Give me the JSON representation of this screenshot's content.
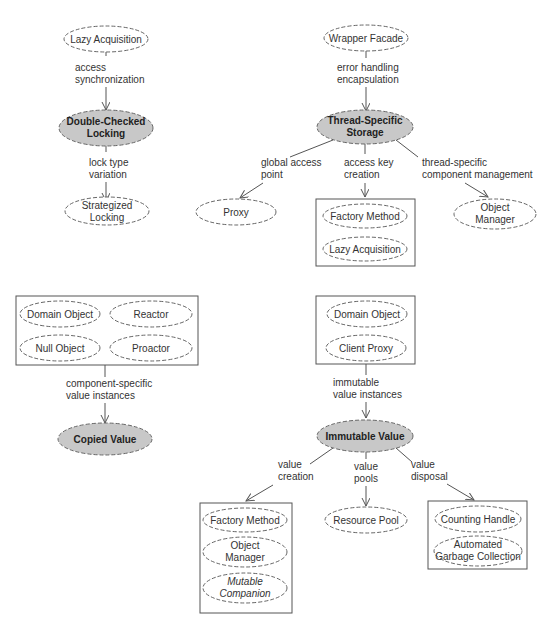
{
  "diagram": {
    "groups": [
      {
        "central": "Double-Checked Locking",
        "incoming": {
          "from": "Lazy Acquisition",
          "label": [
            "access",
            "synchronization"
          ]
        },
        "outgoing": [
          {
            "to": "Strategized Locking",
            "label": [
              "lock type",
              "variation"
            ]
          }
        ]
      },
      {
        "central": "Thread-Specific Storage",
        "incoming": {
          "from": "Wrapper Facade",
          "label": [
            "error handling",
            "encapsulation"
          ]
        },
        "outgoing": [
          {
            "to": "Proxy",
            "label": [
              "global access",
              "point"
            ]
          },
          {
            "to": [
              "Factory Method",
              "Lazy Acquisition"
            ],
            "label": [
              "access key",
              "creation"
            ]
          },
          {
            "to": "Object Manager",
            "label": [
              "thread-specific",
              "component management"
            ]
          }
        ]
      },
      {
        "central": "Copied Value",
        "incoming": {
          "from": [
            "Domain Object",
            "Reactor",
            "Null Object",
            "Proactor"
          ],
          "label": [
            "component-specific",
            "value instances"
          ]
        },
        "outgoing": []
      },
      {
        "central": "Immutable Value",
        "incoming": {
          "from": [
            "Domain Object",
            "Client Proxy"
          ],
          "label": [
            "immutable",
            "value instances"
          ]
        },
        "outgoing": [
          {
            "to": [
              "Factory Method",
              "Object Manager",
              "Mutable Companion"
            ],
            "label": [
              "value",
              "creation"
            ]
          },
          {
            "to": "Resource Pool",
            "label": [
              "value",
              "pools"
            ]
          },
          {
            "to": [
              "Counting Handle",
              "Automated Garbage Collection"
            ],
            "label": [
              "value",
              "disposal"
            ]
          }
        ]
      }
    ],
    "t": {
      "lazy1": "Lazy Acquisition",
      "e1a": "access",
      "e1b": "synchronization",
      "dcl1": "Double-Checked",
      "dcl2": "Locking",
      "e2a": "lock type",
      "e2b": "variation",
      "sl1": "Strategized",
      "sl2": "Locking",
      "wf": "Wrapper Facade",
      "e3a": "error handling",
      "e3b": "encapsulation",
      "tss1": "Thread-Specific",
      "tss2": "Storage",
      "e4a": "global access",
      "e4b": "point",
      "e5a": "access key",
      "e5b": "creation",
      "e6a": "thread-specific",
      "e6b": "component management",
      "proxy": "Proxy",
      "fm1": "Factory Method",
      "lazy2": "Lazy Acquisition",
      "om1a": "Object",
      "om1b": "Manager",
      "do1": "Domain Object",
      "reactor": "Reactor",
      "null": "Null Object",
      "proactor": "Proactor",
      "e7a": "component-specific",
      "e7b": "value instances",
      "cv": "Copied Value",
      "do2": "Domain Object",
      "cp": "Client Proxy",
      "e8a": "immutable",
      "e8b": "value instances",
      "iv": "Immutable Value",
      "e9a": "value",
      "e9b": "creation",
      "e10a": "value",
      "e10b": "pools",
      "e11a": "value",
      "e11b": "disposal",
      "fm2": "Factory Method",
      "om2a": "Object",
      "om2b": "Manager",
      "mc1": "Mutable",
      "mc2": "Companion",
      "rp": "Resource Pool",
      "ch": "Counting Handle",
      "agc1": "Automated",
      "agc2": "Garbage Collection"
    }
  }
}
